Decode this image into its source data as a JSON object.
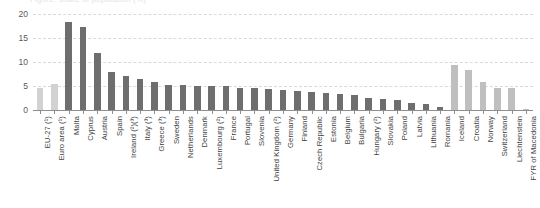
{
  "clipped_header": "Figure: share of population (%)",
  "chart_data": {
    "type": "bar",
    "title": "",
    "subtitle": "",
    "xlabel": "",
    "ylabel": "",
    "ylim": [
      0,
      20
    ],
    "yticks": [
      0,
      5,
      10,
      15,
      20
    ],
    "ytick_labels": [
      "0",
      "5",
      "10",
      "15",
      "20"
    ],
    "grid": true,
    "grid_style": "dashed-horizontal",
    "legend": "none",
    "orientation": "vertical",
    "categories": [
      "EU-27 (¹)",
      "Euro area (¹)",
      "Malta",
      "Cyprus",
      "Austria",
      "Spain",
      "Ireland (²)(³)",
      "Italy (³)",
      "Greece (³)",
      "Sweden",
      "Netherlands",
      "Denmark",
      "Luxembourg (²)",
      "France",
      "Portugal",
      "Slovenia",
      "United Kingdom (²)",
      "Germany",
      "Finland",
      "Czech Republic",
      "Estonia",
      "Belgium",
      "Bulgaria",
      "Hungary (²)",
      "Slovakia",
      "Poland",
      "Latvia",
      "Lithuania",
      "Romania",
      "Iceland",
      "Croatia",
      "Norway",
      "Switzerland",
      "Liechtenstein",
      "FYR of Macedonia"
    ],
    "values": [
      4.5,
      5.5,
      18.3,
      17.2,
      11.8,
      8.0,
      7.0,
      6.5,
      5.9,
      5.3,
      5.3,
      5.1,
      5.0,
      4.9,
      4.6,
      4.5,
      4.3,
      4.2,
      4.0,
      3.7,
      3.5,
      3.3,
      3.1,
      2.5,
      2.2,
      2.0,
      1.5,
      1.3,
      0.7,
      9.3,
      8.3,
      5.8,
      4.5,
      4.5,
      0.2
    ],
    "bar_styles": [
      "light",
      "light",
      "dark",
      "dark",
      "dark",
      "dark",
      "dark",
      "dark",
      "dark",
      "dark",
      "dark",
      "dark",
      "dark",
      "dark",
      "dark",
      "dark",
      "dark",
      "dark",
      "dark",
      "dark",
      "dark",
      "dark",
      "dark",
      "dark",
      "dark",
      "dark",
      "dark",
      "dark",
      "dark",
      "mid",
      "mid",
      "mid",
      "mid",
      "mid",
      "mid"
    ],
    "colors": {
      "dark_bar": "#6e6e6e",
      "light_bar": "#d2d2d2",
      "mid_bar": "#bfbfbf",
      "gridline": "#d9d9dd",
      "axis": "#8d8d92",
      "tick_text": "#59595d",
      "label_text": "#3f3f43"
    }
  }
}
